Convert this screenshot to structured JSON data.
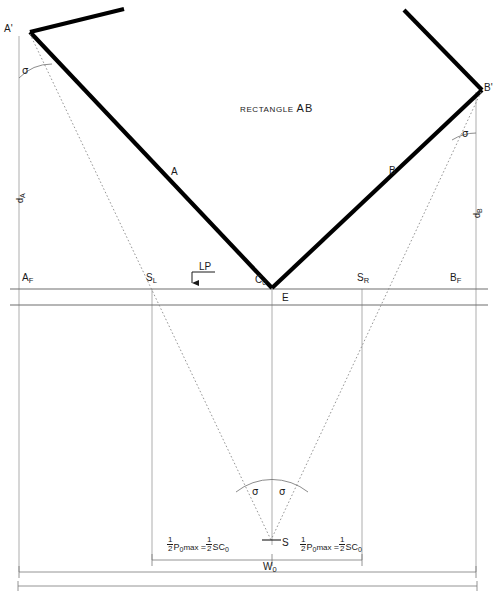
{
  "figure": {
    "title_text": "RECTANGLE",
    "title_emph": "AB",
    "type": "engineering-geometry-diagram"
  },
  "labels": {
    "a_prime": "A'",
    "b_prime": "B'",
    "side_a": "A",
    "side_b": "B",
    "d_a": "d",
    "d_a_sub": "A",
    "d_b": "d",
    "d_b_sub": "B",
    "a_f": "A",
    "a_f_sub": "F",
    "b_f": "B",
    "b_f_sub": "F",
    "s_l": "S",
    "s_l_sub": "L",
    "s_r": "S",
    "s_r_sub": "R",
    "c0": "C",
    "c0_sub": "0",
    "e": "E",
    "s_point": "S",
    "lp": "LP",
    "w0": "W",
    "w0_sub": "0",
    "sigma": "σ"
  },
  "formulas": {
    "left": {
      "frac1_num": "1",
      "frac1_den": "2",
      "p": "P",
      "p_sub": "0",
      "max": "max",
      "eq": "=",
      "frac2_num": "1",
      "frac2_den": "2",
      "sc": "SC",
      "sc_sub": "0"
    },
    "right": {
      "frac1_num": "1",
      "frac1_den": "2",
      "p": "P",
      "p_sub": "0",
      "max": "max",
      "eq": "=",
      "frac2_num": "1",
      "frac2_den": "2",
      "sc": "SC",
      "sc_sub": "0"
    }
  },
  "colors": {
    "ink": "#1a1a1a",
    "thick_line": "#000000",
    "thin_line": "#6e6e6e",
    "dotted_line": "#8a8a8a",
    "background": "#ffffff"
  },
  "geometry": {
    "note": "V-shaped rectangle AB with apex at C0/E on the focal line; dotted sight lines from A' and B' converge at station S below.",
    "apex": {
      "x": 272,
      "y": 288
    },
    "a_prime_pt": {
      "x": 30,
      "y": 32
    },
    "b_prime_pt": {
      "x": 482,
      "y": 90
    },
    "station_s": {
      "x": 271,
      "y": 540
    },
    "focal_line_y": 289,
    "s_l": {
      "x": 152,
      "y": 289
    },
    "s_r": {
      "x": 362,
      "y": 289
    },
    "sigma_count": 4
  }
}
